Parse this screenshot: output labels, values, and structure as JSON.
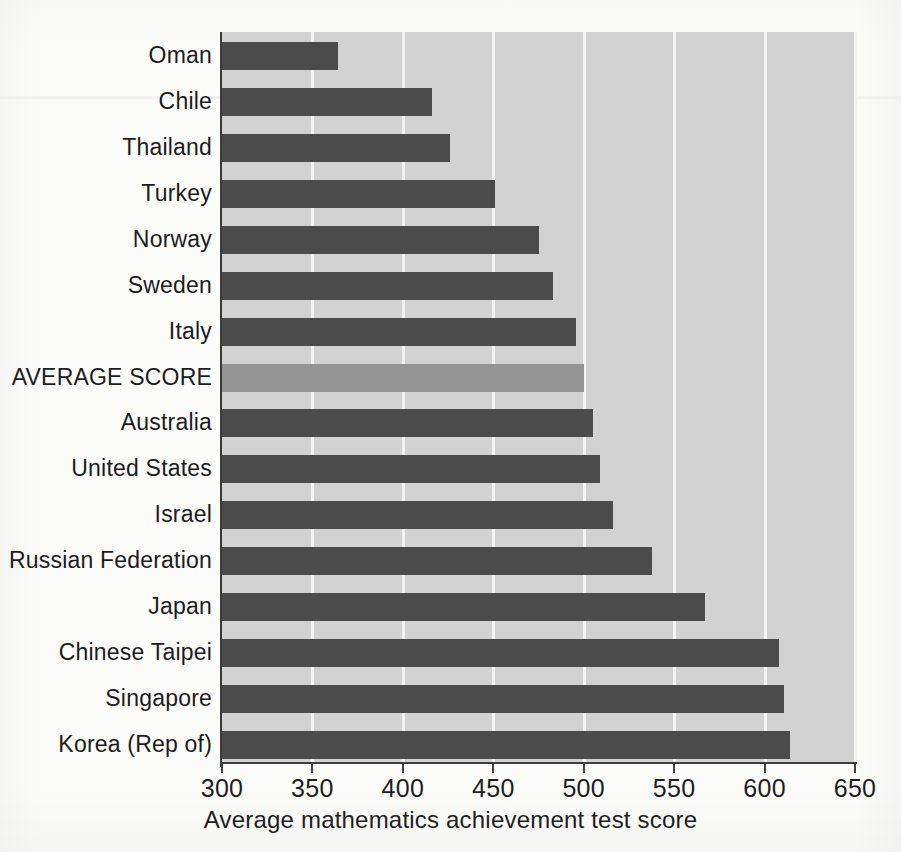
{
  "chart_data": {
    "type": "bar",
    "orientation": "horizontal",
    "title": "",
    "xlabel": "Average mathematics achievement test score",
    "ylabel": "",
    "xlim": [
      300,
      650
    ],
    "xticks": [
      300,
      350,
      400,
      450,
      500,
      550,
      600,
      650
    ],
    "xtick_labels": [
      "300",
      "350",
      "400",
      "450",
      "500",
      "550",
      "600",
      "650"
    ],
    "grid": true,
    "grid_axis": "x",
    "legend": "none",
    "categories": [
      "Oman",
      "Chile",
      "Thailand",
      "Turkey",
      "Norway",
      "Sweden",
      "Italy",
      "AVERAGE SCORE",
      "Australia",
      "United States",
      "Israel",
      "Russian Federation",
      "Japan",
      "Chinese Taipei",
      "Singapore",
      "Korea (Rep of)"
    ],
    "values": [
      364,
      416,
      426,
      451,
      475,
      483,
      496,
      500,
      505,
      509,
      516,
      538,
      567,
      608,
      611,
      614
    ],
    "highlight_index": 7,
    "colors": {
      "bar": "#4b4b4b",
      "bar_highlight": "#949494",
      "plot_background": "#d2d2d2",
      "gridline": "#f2f2f0",
      "axis": "#3f3f3f",
      "text": "#1c1c1c",
      "page_background": "#fbfbfa"
    }
  }
}
